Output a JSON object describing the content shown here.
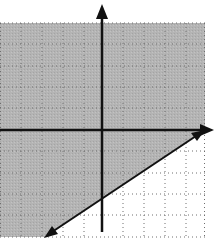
{
  "figure": {
    "type": "linear-inequality-graph",
    "title": "",
    "grid": {
      "x_min": -5,
      "x_max": 5,
      "y_min": -5,
      "y_max": 5,
      "step": 1,
      "style": "dotted"
    },
    "axes": {
      "x_arrow": true,
      "y_arrow": true,
      "labels_shown": false
    },
    "boundary_line": {
      "equation": "y = (3/5)x - 3",
      "slope": 0.6,
      "y_intercept": -3,
      "style": "solid",
      "arrows": true
    },
    "shaded_region": "above boundary line",
    "inequality": "y >= (3/5)x - 3",
    "colors": {
      "shade": "#b4b4b4",
      "grid_dots": "#6e6e6e",
      "axis": "#111111",
      "line": "#111111",
      "background": "#ffffff"
    }
  }
}
